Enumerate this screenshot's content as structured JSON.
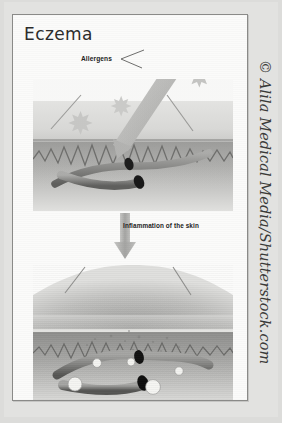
{
  "figure": {
    "title": "Eczema",
    "labels": {
      "allergens": "Allergens",
      "inflammation": "Inflammation of the skin"
    },
    "credit": "© Alila Medical Media/Shutterstock.com",
    "panels": [
      {
        "id": "healthy-skin-exposure",
        "caption_role": "top",
        "depicts": "Allergens and a penetrating allergen arrow entering normal skin, showing epidermis, dermis boundary and two blood vessels",
        "elements": [
          "allergen-particle",
          "allergen-particle",
          "allergen-particle",
          "allergen-particle",
          "penetration-arrow",
          "epidermis-layer",
          "dermis-layer",
          "blood-vessel",
          "blood-vessel",
          "leader-line",
          "leader-line"
        ]
      },
      {
        "id": "inflamed-skin",
        "caption_role": "bottom",
        "depicts": "Swollen inflamed skin with dilated blood vessels and white immune cells migrating into the dermis",
        "elements": [
          "swollen-epidermis",
          "dermis-layer",
          "blood-vessel",
          "blood-vessel",
          "immune-cell",
          "immune-cell",
          "immune-cell",
          "immune-cell",
          "immune-cell",
          "leader-line",
          "leader-line"
        ]
      }
    ],
    "flow_arrow": "down-arrow"
  },
  "colors": {
    "page_background": "#dcdcda",
    "frame_background": "#fbfbfa",
    "frame_border": "#8a8a88",
    "text": "#2b2b2b",
    "epidermis": "#d8d8d6",
    "dermis": "#a8a8a6",
    "vessel": "#8d8d8b",
    "vessel_lumen": "#1d1d1d",
    "immune_cell": "#f2f2ef",
    "allergen": "#c9c9c7",
    "arrow": "#b6b6b4"
  }
}
